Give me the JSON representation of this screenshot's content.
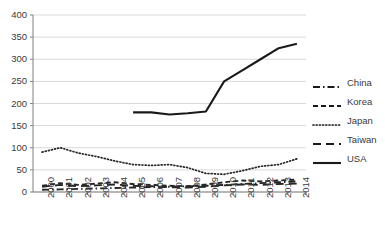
{
  "chart_data": {
    "type": "line",
    "title": "",
    "xlabel": "",
    "ylabel": "",
    "ylim": [
      0,
      400
    ],
    "ytick_step": 50,
    "yticks": [
      "0",
      "50",
      "100",
      "150",
      "200",
      "250",
      "300",
      "350",
      "400"
    ],
    "grid": true,
    "legend_position": "right",
    "categories": [
      "2000",
      "2001",
      "2002",
      "2003",
      "2004",
      "2005",
      "2006",
      "2007",
      "2008",
      "2009",
      "2010",
      "2011",
      "2012",
      "2013",
      "2014"
    ],
    "series": [
      {
        "name": "China",
        "style": "dash-dot",
        "color": "#262626",
        "values": [
          5,
          6,
          7,
          8,
          9,
          10,
          11,
          12,
          13,
          14,
          16,
          18,
          20,
          22,
          24
        ]
      },
      {
        "name": "Korea",
        "style": "dashed",
        "color": "#262626",
        "values": [
          14,
          20,
          16,
          19,
          22,
          18,
          16,
          14,
          13,
          17,
          22,
          26,
          24,
          26,
          28
        ]
      },
      {
        "name": "Japan",
        "style": "dotted",
        "color": "#262626",
        "values": [
          90,
          100,
          88,
          80,
          70,
          62,
          60,
          62,
          55,
          42,
          40,
          48,
          58,
          62,
          75
        ]
      },
      {
        "name": "Taiwan",
        "style": "long-dash",
        "color": "#262626",
        "values": [
          12,
          16,
          13,
          15,
          17,
          14,
          13,
          11,
          10,
          12,
          15,
          17,
          16,
          18,
          19
        ]
      },
      {
        "name": "USA",
        "style": "solid",
        "color": "#1a1a1a",
        "values": [
          null,
          null,
          null,
          null,
          null,
          180,
          180,
          175,
          178,
          182,
          250,
          275,
          300,
          325,
          335
        ]
      }
    ]
  },
  "legend": {
    "items": [
      {
        "label": "China",
        "style": "dash-dot"
      },
      {
        "label": "Korea",
        "style": "dashed"
      },
      {
        "label": "Japan",
        "style": "dotted"
      },
      {
        "label": "Taiwan",
        "style": "long-dash"
      },
      {
        "label": "USA",
        "style": "solid"
      }
    ]
  },
  "colors": {
    "grid": "#d9d9d9",
    "axis": "#808080",
    "text": "#3a3a3a",
    "line": "#1a1a1a"
  }
}
